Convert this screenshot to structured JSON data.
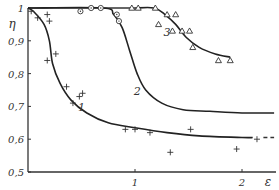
{
  "chart_data": {
    "type": "scatter",
    "title": "",
    "xlabel": "ε",
    "ylabel": "η",
    "xlim": [
      0,
      2.3
    ],
    "ylim": [
      0.5,
      1.0
    ],
    "x_ticks": [
      {
        "value": 1,
        "label": "1"
      },
      {
        "value": 2,
        "label": "2"
      }
    ],
    "y_ticks": [
      {
        "value": 0.5,
        "label": "0,5"
      },
      {
        "value": 0.6,
        "label": "0,6"
      },
      {
        "value": 0.7,
        "label": "0,7"
      },
      {
        "value": 0.8,
        "label": "0,8"
      },
      {
        "value": 0.9,
        "label": "0,9"
      },
      {
        "value": 1.0,
        "label": "1"
      }
    ],
    "grid": false,
    "legend": "none (curves labeled inline 1, 2, 3)",
    "series": [
      {
        "name": "1",
        "marker": "plus",
        "points": [
          [
            0.03,
            0.99
          ],
          [
            0.09,
            0.97
          ],
          [
            0.18,
            0.98
          ],
          [
            0.2,
            0.96
          ],
          [
            0.18,
            0.84
          ],
          [
            0.26,
            0.86
          ],
          [
            0.36,
            0.76
          ],
          [
            0.48,
            0.73
          ],
          [
            0.42,
            0.71
          ],
          [
            0.51,
            0.74
          ],
          [
            0.91,
            0.63
          ],
          [
            1.0,
            0.63
          ],
          [
            1.14,
            0.62
          ],
          [
            1.33,
            0.56
          ],
          [
            1.52,
            0.63
          ],
          [
            1.95,
            0.57
          ],
          [
            2.14,
            0.6
          ]
        ],
        "curve": [
          [
            0,
            1.0
          ],
          [
            0.05,
            0.99
          ],
          [
            0.15,
            0.95
          ],
          [
            0.2,
            0.9
          ],
          [
            0.23,
            0.83
          ],
          [
            0.3,
            0.77
          ],
          [
            0.4,
            0.72
          ],
          [
            0.55,
            0.68
          ],
          [
            0.75,
            0.65
          ],
          [
            1.0,
            0.635
          ],
          [
            1.3,
            0.62
          ],
          [
            1.6,
            0.61
          ],
          [
            2.0,
            0.605
          ],
          [
            2.1,
            0.605
          ]
        ],
        "label_pos": [
          0.5,
          0.685
        ]
      },
      {
        "name": "2",
        "marker": "circle-dot",
        "points": [
          [
            0.49,
            0.99
          ],
          [
            0.59,
            1.0
          ],
          [
            0.68,
            1.0
          ],
          [
            0.83,
            0.98
          ],
          [
            0.85,
            0.96
          ]
        ],
        "curve": [
          [
            0,
            1.0
          ],
          [
            0.7,
            1.0
          ],
          [
            0.8,
            0.98
          ],
          [
            0.88,
            0.94
          ],
          [
            0.95,
            0.87
          ],
          [
            1.02,
            0.8
          ],
          [
            1.1,
            0.75
          ],
          [
            1.25,
            0.71
          ],
          [
            1.45,
            0.69
          ],
          [
            1.7,
            0.685
          ],
          [
            2.0,
            0.68
          ],
          [
            2.3,
            0.68
          ]
        ],
        "label_pos": [
          1.02,
          0.735
        ]
      },
      {
        "name": "3",
        "marker": "triangle",
        "points": [
          [
            0.97,
            1.0
          ],
          [
            1.03,
            1.0
          ],
          [
            1.19,
            1.0
          ],
          [
            1.3,
            0.98
          ],
          [
            1.38,
            0.98
          ],
          [
            1.44,
            0.93
          ],
          [
            1.35,
            0.93
          ],
          [
            1.51,
            0.93
          ],
          [
            1.54,
            0.88
          ],
          [
            1.78,
            0.84
          ],
          [
            1.89,
            0.84
          ],
          [
            1.22,
            0.95
          ]
        ],
        "curve": [
          [
            1.0,
            1.0
          ],
          [
            1.18,
            1.0
          ],
          [
            1.28,
            0.98
          ],
          [
            1.38,
            0.95
          ],
          [
            1.48,
            0.91
          ],
          [
            1.6,
            0.88
          ],
          [
            1.75,
            0.86
          ],
          [
            1.89,
            0.85
          ]
        ],
        "label_pos": [
          1.3,
          0.915
        ]
      }
    ]
  }
}
